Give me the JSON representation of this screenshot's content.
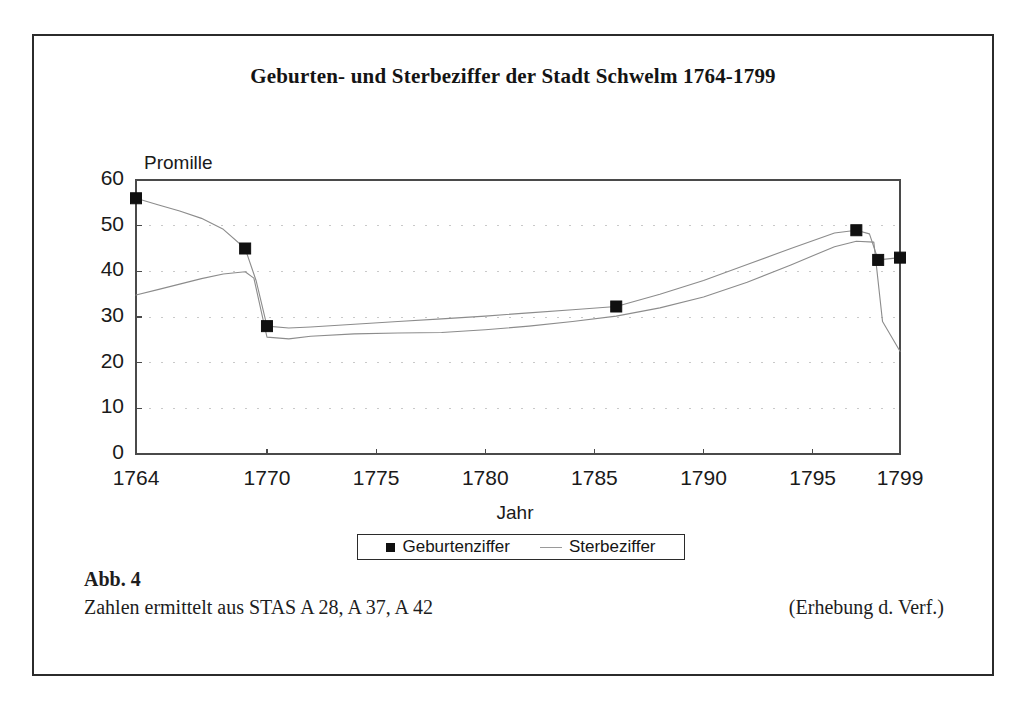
{
  "figure": {
    "title": "Geburten- und Sterbeziffer der Stadt Schwelm 1764-1799",
    "caption_number": "Abb. 4",
    "caption_source": "Zahlen ermittelt aus STAS A 28, A 37, A 42",
    "caption_attribution": "(Erhebung d. Verf.)"
  },
  "legend": {
    "entries": [
      {
        "label": "Geburtenziffer",
        "marker": "filled-square",
        "color": "#101010"
      },
      {
        "label": "Sterbeziffer",
        "marker": "line",
        "color": "#9a9a9a"
      }
    ]
  },
  "chart_data": {
    "type": "line",
    "title": "Geburten- und Sterbeziffer der Stadt Schwelm 1764-1799",
    "xlabel": "Jahr",
    "ylabel": "Promille",
    "xlim": [
      1764,
      1799
    ],
    "ylim": [
      0,
      60
    ],
    "grid": true,
    "grid_style": "dotted-horizontal",
    "legend_position": "bottom-center",
    "xticks": [
      1764,
      1770,
      1775,
      1780,
      1785,
      1790,
      1795,
      1799
    ],
    "xtick_labels": [
      "1764",
      "1770",
      "1775",
      "1780",
      "1785",
      "1790",
      "1795",
      "1799"
    ],
    "yticks": [
      0,
      10,
      20,
      30,
      40,
      50,
      60
    ],
    "ytick_labels": [
      "0",
      "10",
      "20",
      "30",
      "40",
      "50",
      "60"
    ],
    "series": [
      {
        "name": "Geburtenziffer",
        "style": "line-with-markers",
        "color": "#101010",
        "marker": "filled-square",
        "labeled_points": [
          {
            "x": 1764,
            "y": 56.0
          },
          {
            "x": 1769,
            "y": 45.0
          },
          {
            "x": 1770,
            "y": 28.0
          },
          {
            "x": 1786,
            "y": 32.3
          },
          {
            "x": 1797,
            "y": 49.0
          },
          {
            "x": 1798,
            "y": 42.5
          },
          {
            "x": 1799,
            "y": 43.0
          }
        ],
        "x": [
          1764,
          1765,
          1766,
          1767,
          1768,
          1769,
          1769.5,
          1770,
          1771,
          1772,
          1774,
          1776,
          1778,
          1780,
          1782,
          1784,
          1786,
          1788,
          1790,
          1792,
          1794,
          1796,
          1797,
          1797.6,
          1798,
          1799
        ],
        "y": [
          56.0,
          54.6,
          53.2,
          51.6,
          49.2,
          45.0,
          38.0,
          28.0,
          27.6,
          27.8,
          28.4,
          29.0,
          29.6,
          30.2,
          30.9,
          31.6,
          32.3,
          35.0,
          38.0,
          41.5,
          45.0,
          48.4,
          49.0,
          48.2,
          42.5,
          43.0
        ]
      },
      {
        "name": "Sterbeziffer",
        "style": "line",
        "color": "#8c8c8c",
        "x": [
          1764,
          1765,
          1766,
          1767,
          1768,
          1769,
          1769.4,
          1770,
          1771,
          1772,
          1774,
          1776,
          1778,
          1780,
          1782,
          1784,
          1786,
          1788,
          1790,
          1792,
          1794,
          1796,
          1797,
          1797.8,
          1798.2,
          1799
        ],
        "y": [
          34.8,
          36.0,
          37.2,
          38.4,
          39.4,
          39.9,
          38.5,
          25.6,
          25.2,
          25.8,
          26.3,
          26.5,
          26.6,
          27.2,
          28.0,
          29.0,
          30.2,
          32.0,
          34.4,
          37.6,
          41.4,
          45.4,
          46.6,
          46.4,
          29.0,
          22.5
        ]
      }
    ]
  }
}
